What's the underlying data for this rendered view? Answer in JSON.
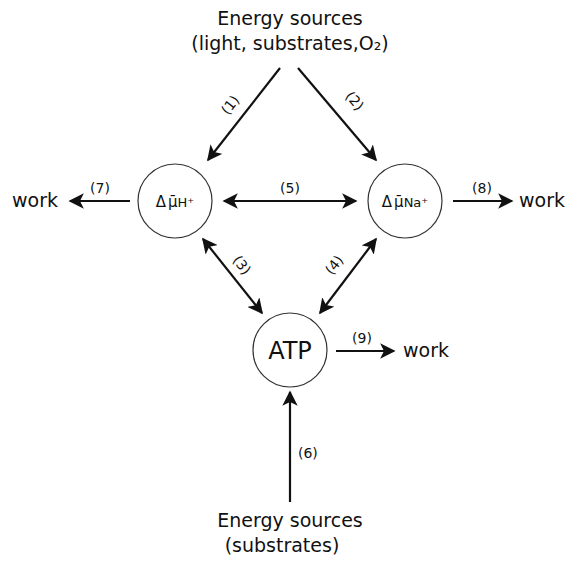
{
  "diagram": {
    "top_source": {
      "line1": "Energy sources",
      "line2": "(light, substrates,O₂)"
    },
    "bottom_source": {
      "line1": "Energy sources",
      "line2": "(substrates)"
    },
    "nodes": {
      "proton_gradient": {
        "delta": "Δ",
        "mu": "μ̄",
        "ion": "H⁺"
      },
      "sodium_gradient": {
        "delta": "Δ",
        "mu": "μ̄",
        "ion": "Na⁺"
      },
      "atp": {
        "label": "ATP"
      }
    },
    "outputs": {
      "work_left": "work",
      "work_right": "work",
      "work_atp": "work"
    },
    "arrows": [
      {
        "id": "1",
        "label": "(1)",
        "from": "top_source",
        "to": "proton_gradient",
        "direction": "one-way"
      },
      {
        "id": "2",
        "label": "(2)",
        "from": "top_source",
        "to": "sodium_gradient",
        "direction": "one-way"
      },
      {
        "id": "3",
        "label": "(3)",
        "from": "proton_gradient",
        "to": "atp",
        "direction": "two-way"
      },
      {
        "id": "4",
        "label": "(4)",
        "from": "sodium_gradient",
        "to": "atp",
        "direction": "two-way"
      },
      {
        "id": "5",
        "label": "(5)",
        "from": "proton_gradient",
        "to": "sodium_gradient",
        "direction": "two-way"
      },
      {
        "id": "6",
        "label": "(6)",
        "from": "bottom_source",
        "to": "atp",
        "direction": "one-way"
      },
      {
        "id": "7",
        "label": "(7)",
        "from": "proton_gradient",
        "to": "work_left",
        "direction": "one-way"
      },
      {
        "id": "8",
        "label": "(8)",
        "from": "sodium_gradient",
        "to": "work_right",
        "direction": "one-way"
      },
      {
        "id": "9",
        "label": "(9)",
        "from": "atp",
        "to": "work_atp",
        "direction": "one-way"
      }
    ],
    "colors": {
      "ink": "#111111",
      "background": "#ffffff"
    }
  }
}
